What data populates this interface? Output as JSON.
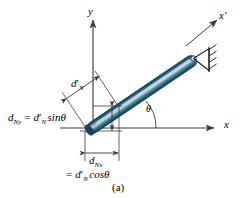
{
  "figure": {
    "caption": "(a)",
    "axes": {
      "y_label": "y",
      "x_label": "x",
      "xprime_label": "x'"
    },
    "angle_label": "θ",
    "dimensions": {
      "rod_perp_symbol": "d",
      "rod_perp_sub": "N",
      "rod_perp_prime": "′",
      "vertical_component": {
        "symbol": "d",
        "sub": "Ny",
        "equals": "=",
        "rhs_symbol": "d",
        "rhs_sub": "N",
        "rhs_prime": "′",
        "rhs_func": "sinθ",
        "full": "d_Ny = d'_N sinθ"
      },
      "horizontal_component": {
        "symbol": "d",
        "sub": "Nx",
        "equals": "=",
        "rhs_symbol": "d",
        "rhs_sub": "N",
        "rhs_prime": "′",
        "rhs_func": "cosθ",
        "full": "d_Nx = d'_N cosθ"
      }
    },
    "colors": {
      "rod_dark": "#1b4f63",
      "rod_mid": "#2f7fa0",
      "rod_highlight": "#b9c6ce",
      "rod_edge": "#14394a",
      "line": "#3a3a3a",
      "text": "#000000",
      "background": "#ffffff"
    },
    "support": {
      "type": "pin-support",
      "hatch_count": 4
    }
  }
}
